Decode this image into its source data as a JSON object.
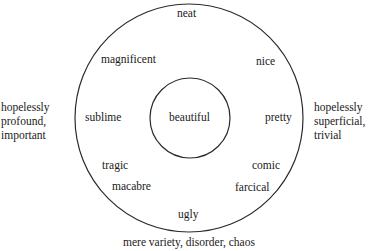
{
  "diagram": {
    "center_label": "beautiful",
    "ring_labels": {
      "top": "neat",
      "upper_left": "magnificent",
      "upper_right": "nice",
      "left": "sublime",
      "right": "pretty",
      "lower_left_1": "tragic",
      "lower_left_2": "macabre",
      "lower_right_1": "comic",
      "lower_right_2": "farcical",
      "bottom": "ugly"
    },
    "outside_labels": {
      "left": [
        "hopelessly",
        "profound,",
        "important"
      ],
      "right": [
        "hopelessly",
        "superficial,",
        "trivial"
      ],
      "bottom": "mere variety, disorder, chaos"
    },
    "colors": {
      "line": "#2a2a2a",
      "text": "#1a1a1a",
      "background": "#ffffff"
    }
  }
}
